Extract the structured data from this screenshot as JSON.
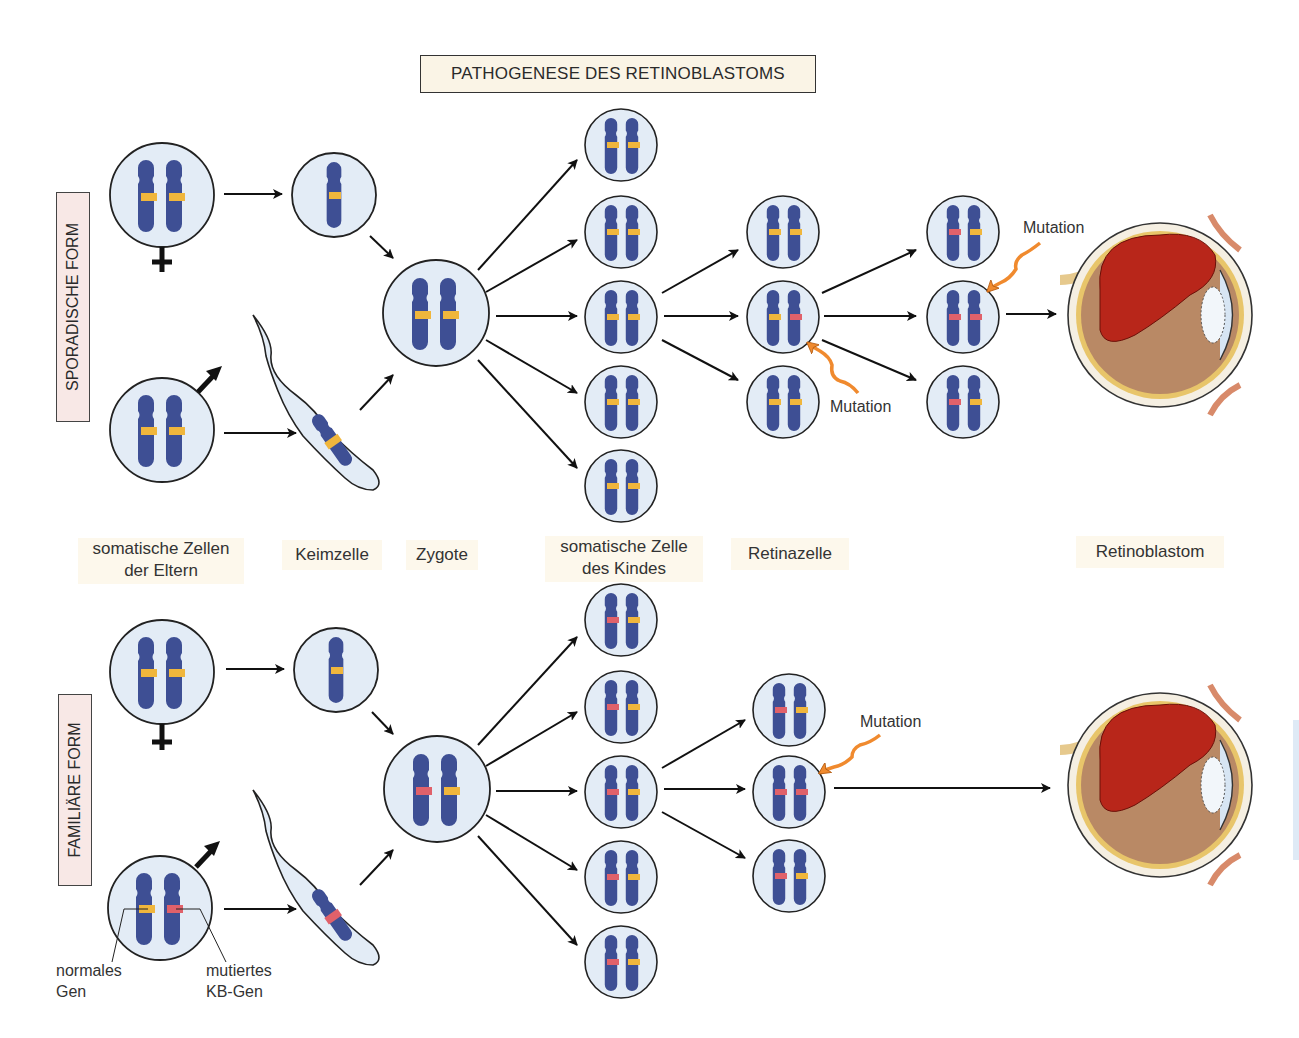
{
  "title": "PATHOGENESE DES RETINOBLASTOMS",
  "rows": {
    "sporadic": {
      "label": "SPORADISCHE FORM"
    },
    "familial": {
      "label": "FAMILIÄRE FORM"
    }
  },
  "stages": [
    {
      "id": "parents",
      "line1": "somatische Zellen",
      "line2": "der Eltern"
    },
    {
      "id": "germ",
      "line1": "Keimzelle",
      "line2": ""
    },
    {
      "id": "zygote",
      "line1": "Zygote",
      "line2": ""
    },
    {
      "id": "child",
      "line1": "somatische Zelle",
      "line2": "des Kindes"
    },
    {
      "id": "retina",
      "line1": "Retinazelle",
      "line2": ""
    },
    {
      "id": "tumor",
      "line1": "Retinoblastom",
      "line2": ""
    }
  ],
  "annotations": {
    "mutation": "Mutation",
    "normal_gene_line1": "normales",
    "normal_gene_line2": "Gen",
    "mutated_gene_line1": "mutiertes",
    "mutated_gene_line2": "KB-Gen"
  },
  "symbols": {
    "female": "female-symbol",
    "male": "male-symbol"
  },
  "colors": {
    "cell_fill": "#e3ecf6",
    "chromosome": "#3e4f94",
    "normal_band": "#f0b63c",
    "mutated_band": "#e0616a",
    "mutation_arrow": "#f08a2e",
    "tumor": "#b8261a",
    "label_bg": "#fdf8ec",
    "form_box_bg": "#f8e8e6"
  },
  "genotypes": {
    "sporadic": {
      "mother": [
        "normal",
        "normal"
      ],
      "egg": [
        "normal"
      ],
      "father": [
        "normal",
        "normal"
      ],
      "sperm": [
        "normal"
      ],
      "zygote": [
        "normal",
        "normal"
      ],
      "child_cells": [
        [
          "normal",
          "normal"
        ],
        [
          "normal",
          "normal"
        ],
        [
          "normal",
          "normal"
        ],
        [
          "normal",
          "normal"
        ],
        [
          "normal",
          "normal"
        ]
      ],
      "retina_cells_1": [
        [
          "normal",
          "normal"
        ],
        [
          "normal",
          "mutated"
        ],
        [
          "normal",
          "normal"
        ]
      ],
      "retina_cells_2": [
        [
          "mutated",
          "normal"
        ],
        [
          "mutated",
          "mutated"
        ],
        [
          "mutated",
          "normal"
        ]
      ]
    },
    "familial": {
      "mother": [
        "normal",
        "normal"
      ],
      "egg": [
        "normal"
      ],
      "father": [
        "normal",
        "mutated"
      ],
      "sperm": [
        "mutated"
      ],
      "zygote": [
        "mutated",
        "normal"
      ],
      "child_cells": [
        [
          "mutated",
          "normal"
        ],
        [
          "mutated",
          "normal"
        ],
        [
          "mutated",
          "normal"
        ],
        [
          "mutated",
          "normal"
        ],
        [
          "mutated",
          "normal"
        ]
      ],
      "retina_cells": [
        [
          "mutated",
          "normal"
        ],
        [
          "mutated",
          "mutated"
        ],
        [
          "mutated",
          "normal"
        ]
      ]
    }
  }
}
